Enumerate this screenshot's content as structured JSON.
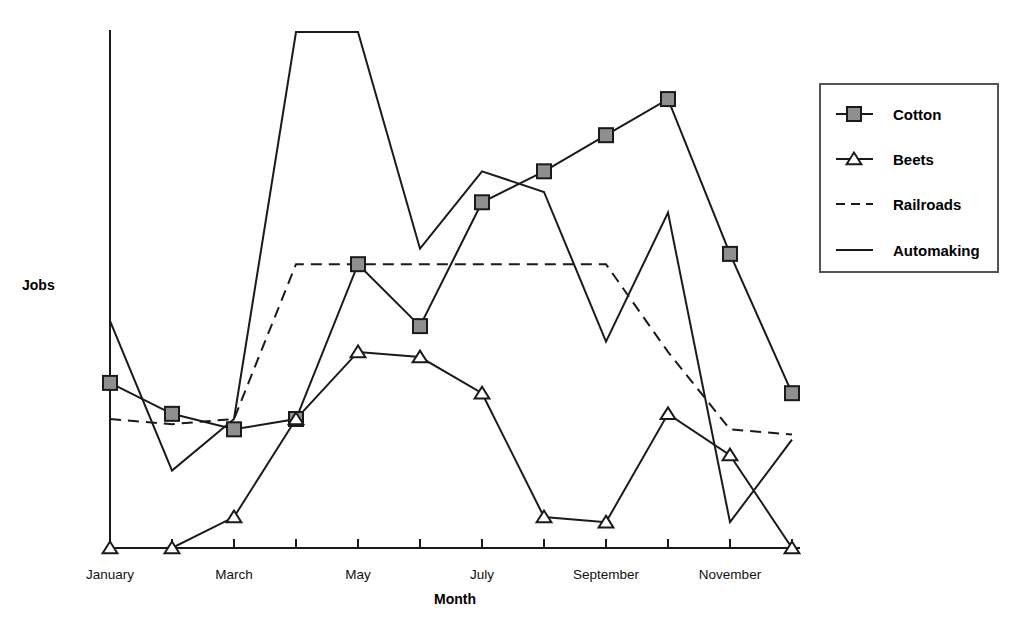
{
  "chart_data": {
    "type": "line",
    "title": "",
    "xlabel": "Month",
    "ylabel": "Jobs",
    "grid": false,
    "legend_position": "right",
    "categories": [
      "January",
      "February",
      "March",
      "April",
      "May",
      "June",
      "July",
      "August",
      "September",
      "October",
      "November",
      "December"
    ],
    "tick_labels_shown": [
      "January",
      "",
      "March",
      "",
      "May",
      "",
      "July",
      "",
      "September",
      "",
      "November",
      ""
    ],
    "xlim": [
      0,
      11
    ],
    "ylim": [
      0,
      100
    ],
    "series": [
      {
        "name": "Cotton",
        "marker": "square",
        "line_style": "solid",
        "values": [
          32,
          26,
          23,
          25,
          55,
          43,
          67,
          73,
          80,
          87,
          57,
          30
        ]
      },
      {
        "name": "Beets",
        "marker": "triangle",
        "line_style": "solid",
        "values": [
          0,
          0,
          6,
          25,
          38,
          37,
          30,
          6,
          5,
          26,
          18,
          0
        ]
      },
      {
        "name": "Railroads",
        "marker": "none",
        "line_style": "dashed",
        "values": [
          25,
          24,
          25,
          55,
          55,
          55,
          55,
          55,
          55,
          38,
          23,
          22
        ]
      },
      {
        "name": "Automaking",
        "marker": "none",
        "line_style": "solid",
        "values": [
          44,
          15,
          25,
          100,
          100,
          58,
          73,
          69,
          40,
          65,
          5,
          21
        ]
      }
    ]
  },
  "legend": {
    "entries": [
      {
        "label": "Cotton"
      },
      {
        "label": "Beets"
      },
      {
        "label": "Railroads"
      },
      {
        "label": "Automaking"
      }
    ]
  },
  "axes": {
    "y_axis_title": "Jobs",
    "x_axis_title": "Month"
  }
}
